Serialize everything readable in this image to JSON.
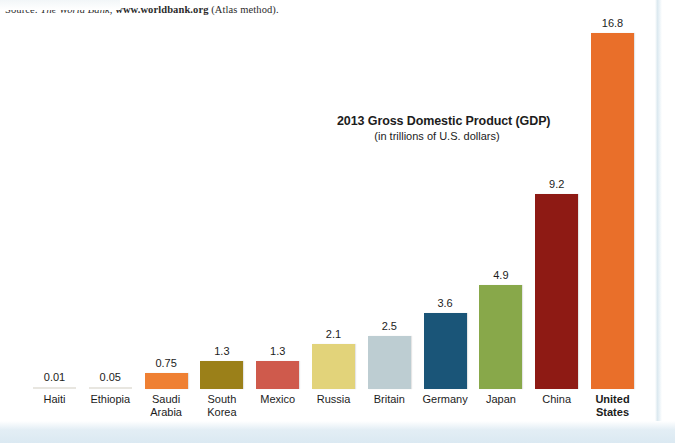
{
  "source": {
    "prefix": "Source: ",
    "publisher": "The World Bank",
    "separator": ", ",
    "url": "www.worldbank.org",
    "suffix": " (Atlas method)."
  },
  "chart_data": {
    "type": "bar",
    "title": "2013 Gross Domestic Product (GDP)",
    "subtitle": "(in trillions of U.S. dollars)",
    "xlabel": "",
    "ylabel": "",
    "ylim": [
      0,
      16.8
    ],
    "grid": false,
    "legend": null,
    "categories": [
      "Haiti",
      "Ethiopia",
      "Saudi Arabia",
      "South Korea",
      "Mexico",
      "Russia",
      "Britain",
      "Germany",
      "Japan",
      "China",
      "United States"
    ],
    "category_lines": [
      [
        "Haiti"
      ],
      [
        "Ethiopia"
      ],
      [
        "Saudi",
        "Arabia"
      ],
      [
        "South",
        "Korea"
      ],
      [
        "Mexico"
      ],
      [
        "Russia"
      ],
      [
        "Britain"
      ],
      [
        "Germany"
      ],
      [
        "Japan"
      ],
      [
        "China"
      ],
      [
        "United",
        "States"
      ]
    ],
    "values": [
      0.01,
      0.05,
      0.75,
      1.3,
      1.3,
      2.1,
      2.5,
      3.6,
      4.9,
      9.2,
      16.8
    ],
    "value_labels": [
      "0.01",
      "0.05",
      "0.75",
      "1.3",
      "1.3",
      "2.1",
      "2.5",
      "3.6",
      "4.9",
      "9.2",
      "16.8"
    ],
    "colors": [
      "#f0f0ee",
      "#f0f0ee",
      "#ef8033",
      "#9b8019",
      "#cf5a4c",
      "#e2d37a",
      "#bdcdd2",
      "#1a5578",
      "#88a84a",
      "#8e1a14",
      "#e96f2a"
    ],
    "highlight_category": "United States"
  }
}
